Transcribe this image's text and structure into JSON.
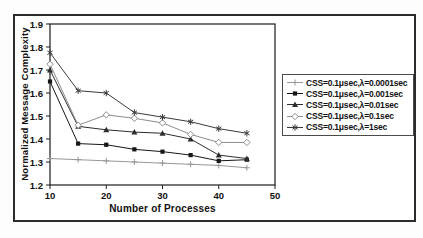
{
  "figure": {
    "kind": "scanned line chart"
  },
  "chart_data": {
    "type": "line",
    "title": "",
    "xlabel": "Number of Processes",
    "ylabel": "Normalized Message Complexity",
    "xlim": [
      10,
      50
    ],
    "ylim": [
      1.2,
      1.9
    ],
    "x_ticks": [
      10,
      20,
      30,
      40,
      50
    ],
    "y_ticks": [
      1.2,
      1.3,
      1.4,
      1.5,
      1.6,
      1.7,
      1.8,
      1.9
    ],
    "grid": false,
    "legend_position": "right-outside",
    "x": [
      10,
      15,
      20,
      25,
      30,
      35,
      40,
      45
    ],
    "series": [
      {
        "name": "CSS=0.1μsec,λ=0.0001sec",
        "marker": "plus",
        "color": "#979797",
        "values": [
          1.315,
          1.31,
          1.305,
          1.3,
          1.295,
          1.29,
          1.285,
          1.275
        ]
      },
      {
        "name": "CSS=0.1μsec,λ=0.001sec",
        "marker": "square",
        "color": "#161616",
        "values": [
          1.65,
          1.38,
          1.375,
          1.355,
          1.345,
          1.33,
          1.305,
          1.31
        ]
      },
      {
        "name": "CSS=0.1μsec,λ=0.01sec",
        "marker": "triangle",
        "color": "#2d2d2d",
        "values": [
          1.7,
          1.455,
          1.44,
          1.43,
          1.425,
          1.4,
          1.33,
          1.315
        ]
      },
      {
        "name": "CSS=0.1μsec,λ=0.1sec",
        "marker": "diamond-open",
        "color": "#8c8c8c",
        "values": [
          1.725,
          1.46,
          1.505,
          1.49,
          1.47,
          1.42,
          1.385,
          1.385
        ]
      },
      {
        "name": "CSS=0.1μsec,λ=1sec",
        "marker": "star",
        "color": "#3a3a3a",
        "values": [
          1.775,
          1.61,
          1.6,
          1.515,
          1.495,
          1.475,
          1.445,
          1.425
        ]
      }
    ]
  }
}
